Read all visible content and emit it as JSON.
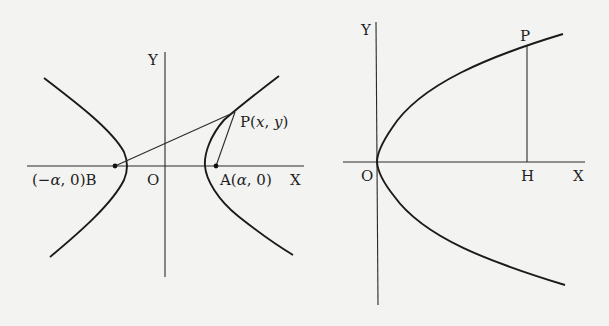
{
  "figures": [
    {
      "id": "hyperbola",
      "axes": {
        "x_label": "X",
        "y_label": "Y",
        "origin_label": "O"
      },
      "points": {
        "B": {
          "label": "(−α, 0)B",
          "coord": "(−α, 0)"
        },
        "A": {
          "label": "A(α, 0)",
          "coord": "(α, 0)"
        },
        "P": {
          "name": "P",
          "coord": "(x, y)",
          "x_var": "x",
          "y_var": "y"
        }
      },
      "segments": [
        "BP",
        "AP"
      ],
      "curve": "hyperbola with two branches symmetric about Y axis"
    },
    {
      "id": "parabola",
      "axes": {
        "x_label": "X",
        "y_label": "Y",
        "origin_label": "O"
      },
      "points": {
        "P": {
          "name": "P"
        },
        "H": {
          "name": "H"
        }
      },
      "segments": [
        "PH"
      ],
      "curve": "parabola opening right with vertex at O"
    }
  ],
  "text": {
    "fig1_y": "Y",
    "fig1_x": "X",
    "fig1_o": "O",
    "fig1_b_open": "(−",
    "fig1_b_alpha": "α",
    "fig1_b_close": ", 0)B",
    "fig1_a_open": "A(",
    "fig1_a_alpha": "α",
    "fig1_a_close": ", 0)",
    "fig1_p_name": "P(",
    "fig1_p_x": "x",
    "fig1_p_comma": ", ",
    "fig1_p_y": "y",
    "fig1_p_close": ")",
    "fig2_y": "Y",
    "fig2_x": "X",
    "fig2_o": "O",
    "fig2_p": "P",
    "fig2_h": "H"
  }
}
